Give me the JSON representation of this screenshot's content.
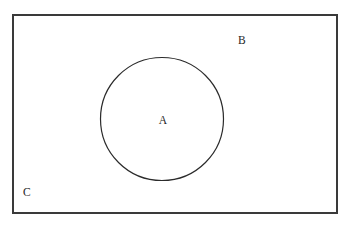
{
  "figure": {
    "type": "venn-diagram",
    "background_color": "#ffffff",
    "width": 351,
    "height": 227
  },
  "shapes": {
    "universe_rectangle": {
      "name": "universe-rectangle",
      "shape": "rectangle",
      "x": 12,
      "y": 14,
      "width": 326,
      "height": 200,
      "stroke_color": "#3a3a3a",
      "stroke_width": 1.6,
      "fill": "none"
    },
    "set_a_circle": {
      "name": "set-a-circle",
      "shape": "circle",
      "cx": 162,
      "cy": 119,
      "r": 61.5,
      "stroke_color": "#2b2b2b",
      "stroke_width": 1.2,
      "fill": "none"
    }
  },
  "labels": {
    "set_a": {
      "text": "A",
      "x": 163,
      "y": 121,
      "color": "#262626",
      "describes": "circle interior"
    },
    "outside_region": {
      "text": "B",
      "x": 242,
      "y": 41,
      "color": "#262626",
      "describes": "region inside rectangle but outside circle"
    },
    "universe": {
      "text": "C",
      "x": 27,
      "y": 193,
      "color": "#262626",
      "describes": "rectangle / universal set"
    }
  }
}
